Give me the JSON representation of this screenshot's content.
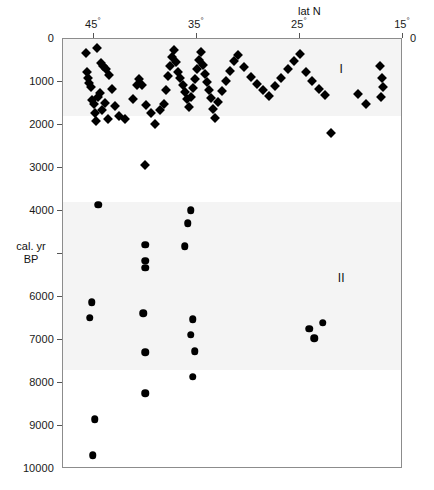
{
  "chart_data": {
    "type": "scatter",
    "title": "",
    "xlabel": "lat N",
    "ylabel": "cal. yr BP",
    "xlabel_text": "lat N",
    "ylabel_line1": "cal. yr",
    "ylabel_line2": "BP",
    "xlim": [
      48,
      15
    ],
    "ylim": [
      0,
      10000
    ],
    "x_axis_reversed": true,
    "y_axis_reversed": true,
    "grid": false,
    "legend_position": "none",
    "xticks": [
      45,
      35,
      25,
      15
    ],
    "xtick_labels": [
      "45°",
      "35°",
      "25°",
      "15°"
    ],
    "yticks": [
      0,
      1000,
      2000,
      3000,
      4000,
      5000,
      6000,
      7000,
      8000,
      9000,
      10000
    ],
    "ytick_labels": [
      "0",
      "1000",
      "2000",
      "3000",
      "4000",
      "",
      "6000",
      "7000",
      "8000",
      "9000",
      "10000"
    ],
    "ytick_labels_right": [
      "0"
    ],
    "annotations": [
      {
        "text": "I",
        "x": 21.0,
        "y": 700
      },
      {
        "text": "II",
        "x": 21.0,
        "y": 5560
      }
    ],
    "shaded_bands": [
      {
        "y_from": 0,
        "y_to": 1800
      },
      {
        "y_from": 3800,
        "y_to": 7700
      }
    ],
    "series": [
      {
        "name": "Unit I",
        "marker": "diamond",
        "color": "#000000",
        "points": [
          [
            45.8,
            330
          ],
          [
            45.7,
            760
          ],
          [
            45.6,
            900
          ],
          [
            45.5,
            1020
          ],
          [
            45.3,
            1120
          ],
          [
            45.2,
            1420
          ],
          [
            45.0,
            1500
          ],
          [
            44.9,
            1720
          ],
          [
            44.8,
            1900
          ],
          [
            44.6,
            1360
          ],
          [
            44.4,
            1260
          ],
          [
            44.2,
            1640
          ],
          [
            43.9,
            1480
          ],
          [
            43.6,
            1860
          ],
          [
            44.7,
            220
          ],
          [
            44.3,
            560
          ],
          [
            44.1,
            620
          ],
          [
            43.8,
            700
          ],
          [
            43.5,
            840
          ],
          [
            43.2,
            1160
          ],
          [
            43.0,
            1560
          ],
          [
            42.6,
            1800
          ],
          [
            42.0,
            1860
          ],
          [
            41.2,
            1400
          ],
          [
            40.8,
            1060
          ],
          [
            40.6,
            940
          ],
          [
            40.3,
            1080
          ],
          [
            39.9,
            1540
          ],
          [
            39.5,
            1720
          ],
          [
            39.1,
            1980
          ],
          [
            38.6,
            1660
          ],
          [
            38.2,
            1520
          ],
          [
            38.0,
            1180
          ],
          [
            37.8,
            860
          ],
          [
            37.6,
            620
          ],
          [
            37.4,
            420
          ],
          [
            37.2,
            260
          ],
          [
            37.0,
            540
          ],
          [
            36.8,
            760
          ],
          [
            36.6,
            900
          ],
          [
            36.4,
            1060
          ],
          [
            36.2,
            1240
          ],
          [
            36.0,
            1400
          ],
          [
            35.8,
            1580
          ],
          [
            35.6,
            1340
          ],
          [
            35.4,
            1140
          ],
          [
            35.2,
            940
          ],
          [
            35.0,
            700
          ],
          [
            34.8,
            480
          ],
          [
            34.6,
            300
          ],
          [
            34.4,
            600
          ],
          [
            34.2,
            820
          ],
          [
            34.0,
            1000
          ],
          [
            33.8,
            1180
          ],
          [
            33.6,
            1380
          ],
          [
            33.4,
            1620
          ],
          [
            33.2,
            1840
          ],
          [
            33.0,
            1460
          ],
          [
            32.6,
            1220
          ],
          [
            32.2,
            980
          ],
          [
            31.8,
            740
          ],
          [
            31.4,
            520
          ],
          [
            31.0,
            380
          ],
          [
            30.4,
            660
          ],
          [
            29.8,
            880
          ],
          [
            29.2,
            1040
          ],
          [
            28.6,
            1180
          ],
          [
            28.0,
            1320
          ],
          [
            27.4,
            1100
          ],
          [
            26.8,
            900
          ],
          [
            26.2,
            700
          ],
          [
            25.6,
            520
          ],
          [
            25.0,
            340
          ],
          [
            24.4,
            760
          ],
          [
            23.8,
            980
          ],
          [
            23.2,
            1160
          ],
          [
            22.6,
            1300
          ],
          [
            22.0,
            2180
          ],
          [
            40.0,
            2940
          ],
          [
            17.2,
            620
          ],
          [
            17.0,
            900
          ],
          [
            16.9,
            1120
          ],
          [
            17.1,
            1340
          ],
          [
            18.6,
            1520
          ],
          [
            19.4,
            1280
          ]
        ]
      },
      {
        "name": "Unit II",
        "marker": "circle",
        "color": "#000000",
        "points": [
          [
            44.6,
            3860
          ],
          [
            45.2,
            6120
          ],
          [
            45.4,
            6480
          ],
          [
            44.9,
            8840
          ],
          [
            45.1,
            9680
          ],
          [
            40.0,
            4780
          ],
          [
            40.0,
            5160
          ],
          [
            40.0,
            5320
          ],
          [
            40.2,
            6380
          ],
          [
            40.0,
            7280
          ],
          [
            40.0,
            8240
          ],
          [
            35.6,
            3980
          ],
          [
            35.9,
            4280
          ],
          [
            36.2,
            4820
          ],
          [
            35.4,
            6520
          ],
          [
            35.6,
            6880
          ],
          [
            35.2,
            7260
          ],
          [
            35.4,
            7850
          ],
          [
            24.1,
            6740
          ],
          [
            22.8,
            6600
          ],
          [
            23.6,
            6960
          ]
        ]
      }
    ]
  },
  "geometry": {
    "plot_left": 62,
    "plot_top": 38,
    "plot_right": 402,
    "plot_bottom": 468
  }
}
